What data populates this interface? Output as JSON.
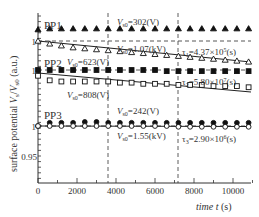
{
  "chart_data": {
    "type": "scatter",
    "title": "",
    "xlabel": "time t (s)",
    "ylabel": "surface potential V_s/V_s0 (a.u.)",
    "xlim": [
      0,
      11000
    ],
    "x_ticks": [
      0,
      2000,
      4000,
      6000,
      8000,
      10000
    ],
    "x_tick_labels": [
      "0",
      "2000",
      "4000",
      "6000",
      "8000",
      "10000"
    ],
    "y_tick_labels": [
      "1",
      "1",
      "1",
      "0.95"
    ],
    "grid": false,
    "vertical_dashed_lines_x": [
      3600,
      7200
    ],
    "panels": [
      {
        "name": "PP1",
        "baseline_label": "1",
        "series": [
          {
            "name": "PP1 filled triangle",
            "marker": "triangle-filled",
            "Vs0_label": "V_s0=302(V)",
            "x": [
              0,
              600,
              1200,
              1800,
              2400,
              3000,
              3600,
              4200,
              4800,
              5400,
              6000,
              6600,
              7200,
              7800,
              8400,
              9000,
              9600,
              10200,
              10800
            ],
            "values": [
              1.012,
              1.013,
              1.013,
              1.013,
              1.013,
              1.013,
              1.013,
              1.013,
              1.013,
              1.013,
              1.013,
              1.013,
              1.013,
              1.013,
              1.013,
              1.013,
              1.013,
              1.013,
              1.013
            ]
          },
          {
            "name": "PP1 open triangle",
            "marker": "triangle-open",
            "Vs0_label": "V_s0=1.07(kV)",
            "tau_label": "τ1=4.37×10^5(s)",
            "x": [
              0,
              600,
              1200,
              1800,
              2400,
              3000,
              3600,
              4200,
              4800,
              5400,
              6000,
              6600,
              7200,
              7800,
              8400,
              9000,
              9600,
              10200,
              10800
            ],
            "values": [
              1.0,
              0.997,
              0.995,
              0.993,
              0.992,
              0.991,
              0.99,
              0.989,
              0.988,
              0.987,
              0.986,
              0.985,
              0.984,
              0.983,
              0.982,
              0.981,
              0.98,
              0.979,
              0.978
            ]
          }
        ]
      },
      {
        "name": "PP2",
        "baseline_label": "1",
        "series": [
          {
            "name": "PP2 filled square",
            "marker": "square-filled",
            "Vs0_label": "V_s0=623(V)",
            "x": [
              0,
              600,
              1200,
              1800,
              2400,
              3000,
              3600,
              4200,
              4800,
              5400,
              6000,
              6600,
              7200,
              7800,
              8400,
              9000,
              9600,
              10200,
              10800
            ],
            "values": [
              1.0,
              1.0,
              1.0,
              1.0,
              1.0,
              1.0,
              1.0,
              1.0,
              1.0,
              1.0,
              1.0,
              0.999,
              0.999,
              0.999,
              0.999,
              0.999,
              0.999,
              0.999,
              0.999
            ]
          },
          {
            "name": "PP2 open square",
            "marker": "square-open",
            "Vs0_label": "V_s0=808(V)",
            "tau_label": "τ2=5.80×10^7(s)",
            "x": [
              0,
              600,
              1200,
              1800,
              2400,
              3000,
              3600,
              4200,
              4800,
              5400,
              6000,
              6600,
              7200,
              7800,
              8400,
              9000,
              9600,
              10200,
              10800
            ],
            "values": [
              0.995,
              0.991,
              0.99,
              0.99,
              0.99,
              0.99,
              0.99,
              0.989,
              0.989,
              0.988,
              0.988,
              0.988,
              0.987,
              0.987,
              0.987,
              0.986,
              0.986,
              0.986,
              0.985
            ]
          }
        ]
      },
      {
        "name": "PP3",
        "baseline_label": "1",
        "series": [
          {
            "name": "PP3 filled circle",
            "marker": "circle-filled",
            "Vs0_label": "V_s0=242(V)",
            "x": [
              0,
              600,
              1200,
              1800,
              2400,
              3000,
              3600,
              4200,
              4800,
              5400,
              6000,
              6600,
              7200,
              7800,
              8400,
              9000,
              9600,
              10200,
              10800
            ],
            "values": [
              1.0,
              1.004,
              1.004,
              1.004,
              1.005,
              1.005,
              1.004,
              1.004,
              1.004,
              1.004,
              1.004,
              1.004,
              1.004,
              1.004,
              1.004,
              1.004,
              1.004,
              1.004,
              1.004
            ]
          },
          {
            "name": "PP3 open circle",
            "marker": "circle-open",
            "Vs0_label": "V_s0=1.55(kV)",
            "tau_label": "τ3=2.90×10^6(s)",
            "x": [
              0,
              600,
              1200,
              1800,
              2400,
              3000,
              3600,
              4200,
              4800,
              5400,
              6000,
              6600,
              7200,
              7800,
              8400,
              9000,
              9600,
              10200,
              10800
            ],
            "values": [
              1.0,
              1.0,
              1.0,
              1.0,
              1.0,
              1.0,
              1.0,
              1.0,
              1.0,
              1.0,
              1.0,
              1.0,
              0.999,
              0.999,
              0.999,
              0.999,
              0.999,
              0.999,
              0.999
            ]
          }
        ]
      }
    ]
  },
  "labels": {
    "pp1": "PP1",
    "pp2": "PP2",
    "pp3": "PP3",
    "pp1_filled_v": "=302(V)",
    "pp1_open_v": "=1.07(kV)",
    "pp2_filled_v": "=623(V)",
    "pp2_open_v": "=808(V)",
    "pp3_filled_v": "=242(V)",
    "pp3_open_v": "=1.55(kV)",
    "vs0_main": "V",
    "vs0_sub": "s0",
    "tau1_pre": "τ",
    "tau1_sub": "1",
    "tau1_val": "=4.37×10",
    "tau1_exp": "5",
    "tau2_sub": "2",
    "tau2_val": "=5.80×10",
    "tau2_exp": "7",
    "tau3_sub": "3",
    "tau3_val": "=2.90×10",
    "tau3_exp": "6",
    "s_unit": "(s)",
    "y1": "1",
    "y2": "1",
    "y3": "1",
    "y095": "0.95",
    "x0": "0",
    "x2000": "2000",
    "x4000": "4000",
    "x6000": "6000",
    "x8000": "8000",
    "x10000": "10000",
    "xlabel_main": "time ",
    "xlabel_var": "t",
    "xlabel_unit": " (s)",
    "ylabel_pre": "surface potential ",
    "ylabel_v": "V",
    "ylabel_s": "s",
    "ylabel_slash": "/",
    "ylabel_v2": "V",
    "ylabel_s0": "s0",
    "ylabel_unit": " (a.u.)"
  }
}
